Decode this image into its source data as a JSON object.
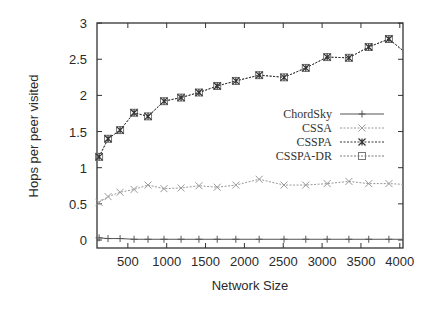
{
  "chart_data": {
    "type": "line",
    "title": "",
    "xlabel": "Network Size",
    "ylabel": "Hops per peer visited",
    "xlim": [
      100,
      4040
    ],
    "ylim": [
      0,
      3
    ],
    "xticks": [
      500,
      1000,
      1500,
      2000,
      2500,
      3000,
      3500,
      4000
    ],
    "yticks": [
      0,
      0.5,
      1,
      1.5,
      2,
      2.5,
      3
    ],
    "ytick_labels": [
      "0",
      "0.5",
      "1",
      "1.5",
      "2",
      "2.5",
      "3"
    ],
    "xtick_labels": [
      "500",
      "1000",
      "1500",
      "2000",
      "2500",
      "3000",
      "3500",
      "4000"
    ],
    "grid": false,
    "legend_position": "right-middle inside",
    "x": [
      130,
      245,
      400,
      580,
      760,
      965,
      1185,
      1415,
      1650,
      1890,
      2190,
      2510,
      2790,
      3065,
      3345,
      3600,
      3860,
      4040
    ],
    "series": [
      {
        "name": "ChordSky",
        "marker": "plus",
        "line_style": "solid",
        "color": "#555555",
        "values": [
          0.03,
          0.02,
          0.02,
          0.01,
          0.01,
          0.01,
          0.01,
          0.01,
          0.01,
          0.01,
          0.01,
          0.01,
          0.01,
          0.01,
          0.01,
          0.01,
          0.01,
          0.01
        ]
      },
      {
        "name": "CSSA",
        "marker": "x",
        "line_style": "dotted",
        "color": "#999999",
        "values": [
          0.52,
          0.6,
          0.66,
          0.7,
          0.76,
          0.71,
          0.72,
          0.75,
          0.73,
          0.76,
          0.84,
          0.76,
          0.76,
          0.78,
          0.81,
          0.78,
          0.78,
          0.77
        ]
      },
      {
        "name": "CSSPA",
        "marker": "asterisk",
        "line_style": "dotted",
        "color": "#333333",
        "values": [
          1.15,
          1.4,
          1.52,
          1.76,
          1.71,
          1.92,
          1.97,
          2.04,
          2.13,
          2.2,
          2.28,
          2.25,
          2.38,
          2.53,
          2.52,
          2.67,
          2.78,
          2.62
        ]
      },
      {
        "name": "CSSPA-DR",
        "marker": "square",
        "line_style": "dotted",
        "color": "#777777",
        "values": [
          1.15,
          1.4,
          1.52,
          1.76,
          1.71,
          1.92,
          1.97,
          2.04,
          2.13,
          2.2,
          2.28,
          2.25,
          2.38,
          2.53,
          2.52,
          2.67,
          2.78,
          2.62
        ]
      }
    ]
  },
  "plot_frame": {
    "left": 97,
    "right": 403,
    "top": 23,
    "bottom": 248
  },
  "axis_map": {
    "x0_px": 89,
    "px_per_unit_x": 0.0777,
    "y0_px": 240,
    "px_per_unit_y": 72.3
  }
}
